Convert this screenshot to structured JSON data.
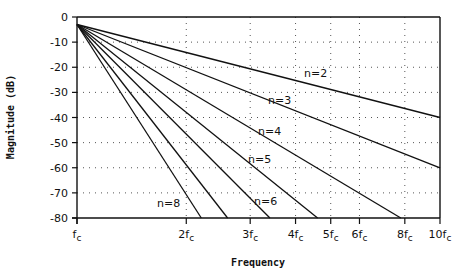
{
  "chart_data": {
    "type": "line",
    "title": "",
    "xlabel": "Frequency",
    "ylabel": "Magnitude (dB)",
    "x_scale": "log",
    "xlim": [
      "fc",
      "10fc"
    ],
    "ylim": [
      -80,
      0
    ],
    "grid": true,
    "y_ticks": [
      "0",
      "-10",
      "-20",
      "-30",
      "-40",
      "-50",
      "-60",
      "-70",
      "-80"
    ],
    "x_ticks": [
      {
        "base": "f",
        "mult": "",
        "sub": "c",
        "value": 1
      },
      {
        "base": "f",
        "mult": "2",
        "sub": "c",
        "value": 2
      },
      {
        "base": "f",
        "mult": "3",
        "sub": "c",
        "value": 3
      },
      {
        "base": "f",
        "mult": "4",
        "sub": "c",
        "value": 4
      },
      {
        "base": "f",
        "mult": "5",
        "sub": "c",
        "value": 5
      },
      {
        "base": "f",
        "mult": "6",
        "sub": "c",
        "value": 6
      },
      {
        "base": "f",
        "mult": "8",
        "sub": "c",
        "value": 8
      },
      {
        "base": "f",
        "mult": "10",
        "sub": "c",
        "value": 10
      }
    ],
    "series": [
      {
        "name": "n=2",
        "label": "n=2",
        "points": [
          [
            1,
            -3
          ],
          [
            10,
            -40
          ]
        ]
      },
      {
        "name": "n=3",
        "label": "n=3",
        "points": [
          [
            1,
            -3
          ],
          [
            10,
            -60
          ]
        ]
      },
      {
        "name": "n=4",
        "label": "n=4",
        "points": [
          [
            1,
            -3
          ],
          [
            7.8,
            -80
          ]
        ]
      },
      {
        "name": "n=5",
        "label": "n=5",
        "points": [
          [
            1,
            -3
          ],
          [
            4.6,
            -80
          ]
        ]
      },
      {
        "name": "n=6",
        "label": "n=6",
        "points": [
          [
            1,
            -3
          ],
          [
            3.4,
            -80
          ]
        ]
      },
      {
        "name": "n=7",
        "label": "",
        "points": [
          [
            1,
            -3
          ],
          [
            2.6,
            -80
          ]
        ]
      },
      {
        "name": "n=8",
        "label": "n=8",
        "points": [
          [
            1,
            -3
          ],
          [
            2.2,
            -80
          ]
        ]
      }
    ],
    "legend": "none (inline labels)"
  }
}
